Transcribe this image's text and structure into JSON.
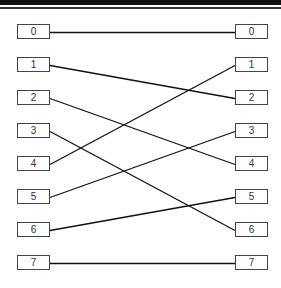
{
  "diagram": {
    "type": "permutation-network",
    "left_nodes": [
      "0",
      "1",
      "2",
      "3",
      "4",
      "5",
      "6",
      "7"
    ],
    "right_nodes": [
      "0",
      "1",
      "2",
      "3",
      "4",
      "5",
      "6",
      "7"
    ],
    "connections": [
      {
        "from": 0,
        "to": 0
      },
      {
        "from": 1,
        "to": 2
      },
      {
        "from": 2,
        "to": 4
      },
      {
        "from": 3,
        "to": 6
      },
      {
        "from": 4,
        "to": 1
      },
      {
        "from": 5,
        "to": 3
      },
      {
        "from": 6,
        "to": 5
      },
      {
        "from": 7,
        "to": 7
      }
    ],
    "line_color": "#111111",
    "box_border_color": "#444444"
  }
}
